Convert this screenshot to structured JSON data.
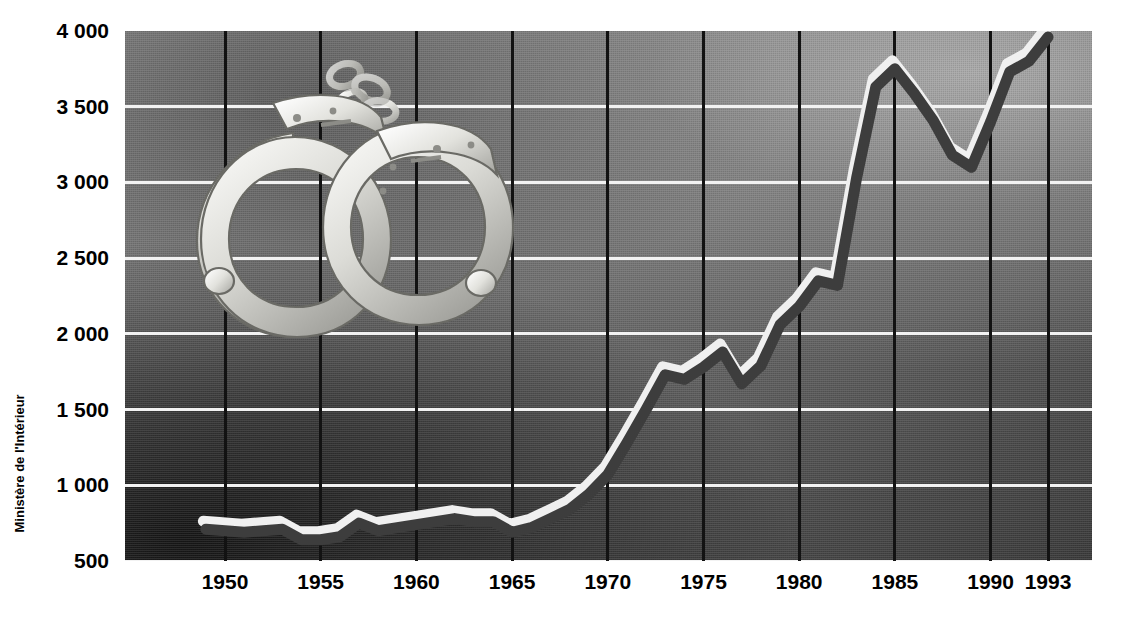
{
  "chart_data": {
    "type": "line",
    "title": "",
    "xlabel": "",
    "ylabel": "",
    "source": "Ministère de l'Intérieur",
    "grid": true,
    "legend": "none",
    "xlim": [
      1949,
      1993
    ],
    "ylim": [
      500,
      4000
    ],
    "ytick_labels": [
      "4 000",
      "3 500",
      "3 000",
      "2 500",
      "2 000",
      "1 500",
      "1 000",
      "500"
    ],
    "ytick_values": [
      4000,
      3500,
      3000,
      2500,
      2000,
      1500,
      1000,
      500
    ],
    "xtick_labels": [
      "1950",
      "1955",
      "1960",
      "1965",
      "1970",
      "1975",
      "1980",
      "1985",
      "1990",
      "1993"
    ],
    "xtick_values": [
      1950,
      1955,
      1960,
      1965,
      1970,
      1975,
      1980,
      1985,
      1990,
      1993
    ],
    "series": [
      {
        "name": "serie",
        "x": [
          1949,
          1950,
          1951,
          1952,
          1953,
          1954,
          1955,
          1956,
          1957,
          1958,
          1959,
          1960,
          1961,
          1962,
          1963,
          1964,
          1965,
          1966,
          1967,
          1968,
          1969,
          1970,
          1971,
          1972,
          1973,
          1974,
          1975,
          1976,
          1977,
          1978,
          1979,
          1980,
          1981,
          1982,
          1983,
          1984,
          1985,
          1986,
          1987,
          1988,
          1989,
          1990,
          1991,
          1992,
          1993
        ],
        "y": [
          710,
          700,
          690,
          700,
          710,
          640,
          640,
          660,
          750,
          700,
          720,
          740,
          760,
          780,
          760,
          760,
          690,
          720,
          780,
          840,
          940,
          1070,
          1280,
          1500,
          1730,
          1700,
          1780,
          1880,
          1670,
          1790,
          2060,
          2180,
          2350,
          2320,
          3030,
          3630,
          3750,
          3590,
          3410,
          3180,
          3100,
          3400,
          3730,
          3800,
          3960
        ]
      }
    ]
  },
  "colors": {
    "line": "#3d3d3d",
    "line_highlight": "#f0f0f0",
    "hgrid": "#f2f2f2",
    "vgrid": "#121212",
    "axis_text": "#000000",
    "plot_bg": "#6e6e6e",
    "page_bg": "#ffffff"
  },
  "illustration": {
    "name": "handcuffs-illustration",
    "alt": "handcuffs"
  }
}
